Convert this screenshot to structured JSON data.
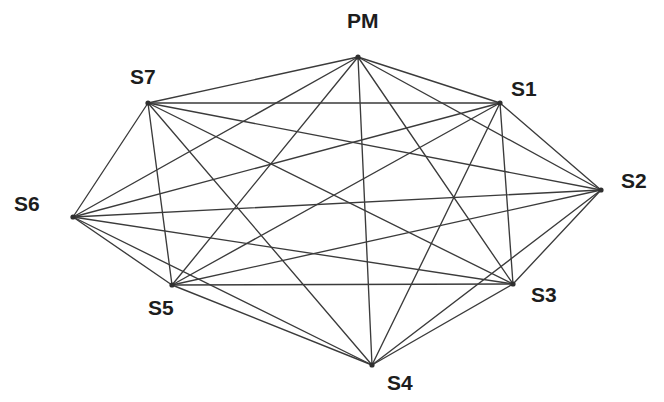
{
  "figure": {
    "title": "",
    "background_color": "#ffffff",
    "width": 664,
    "height": 402
  },
  "chart_data": {
    "type": "diagram",
    "graph_kind": "complete-graph",
    "title": "",
    "node_count": 8,
    "edge_count": 28,
    "edge_color": "#3b3b3b",
    "node_color": "#2f2f2f",
    "background": "#ffffff",
    "nodes": [
      {
        "id": "PM",
        "label": "PM",
        "x": 358,
        "y": 57,
        "label_x": 347,
        "label_y": 10,
        "label_anchor": "top"
      },
      {
        "id": "S1",
        "label": "S1",
        "x": 500,
        "y": 103,
        "label_x": 511,
        "label_y": 78,
        "label_anchor": "top-right"
      },
      {
        "id": "S2",
        "label": "S2",
        "x": 601,
        "y": 190,
        "label_x": 621,
        "label_y": 170,
        "label_anchor": "right"
      },
      {
        "id": "S3",
        "label": "S3",
        "x": 513,
        "y": 284,
        "label_x": 531,
        "label_y": 284,
        "label_anchor": "bottom-right"
      },
      {
        "id": "S4",
        "label": "S4",
        "x": 372,
        "y": 365,
        "label_x": 387,
        "label_y": 372,
        "label_anchor": "bottom"
      },
      {
        "id": "S5",
        "label": "S5",
        "x": 172,
        "y": 285,
        "label_x": 148,
        "label_y": 297,
        "label_anchor": "bottom-left"
      },
      {
        "id": "S6",
        "label": "S6",
        "x": 73,
        "y": 217,
        "label_x": 14,
        "label_y": 193,
        "label_anchor": "left"
      },
      {
        "id": "S7",
        "label": "S7",
        "x": 148,
        "y": 103,
        "label_x": 130,
        "label_y": 66,
        "label_anchor": "top-left"
      }
    ],
    "edges": [
      [
        "PM",
        "S1"
      ],
      [
        "PM",
        "S2"
      ],
      [
        "PM",
        "S3"
      ],
      [
        "PM",
        "S4"
      ],
      [
        "PM",
        "S5"
      ],
      [
        "PM",
        "S6"
      ],
      [
        "PM",
        "S7"
      ],
      [
        "S1",
        "S2"
      ],
      [
        "S1",
        "S3"
      ],
      [
        "S1",
        "S4"
      ],
      [
        "S1",
        "S5"
      ],
      [
        "S1",
        "S6"
      ],
      [
        "S1",
        "S7"
      ],
      [
        "S2",
        "S3"
      ],
      [
        "S2",
        "S4"
      ],
      [
        "S2",
        "S5"
      ],
      [
        "S2",
        "S6"
      ],
      [
        "S2",
        "S7"
      ],
      [
        "S3",
        "S4"
      ],
      [
        "S3",
        "S5"
      ],
      [
        "S3",
        "S6"
      ],
      [
        "S3",
        "S7"
      ],
      [
        "S4",
        "S5"
      ],
      [
        "S4",
        "S6"
      ],
      [
        "S4",
        "S7"
      ],
      [
        "S5",
        "S6"
      ],
      [
        "S5",
        "S7"
      ],
      [
        "S6",
        "S7"
      ]
    ]
  }
}
